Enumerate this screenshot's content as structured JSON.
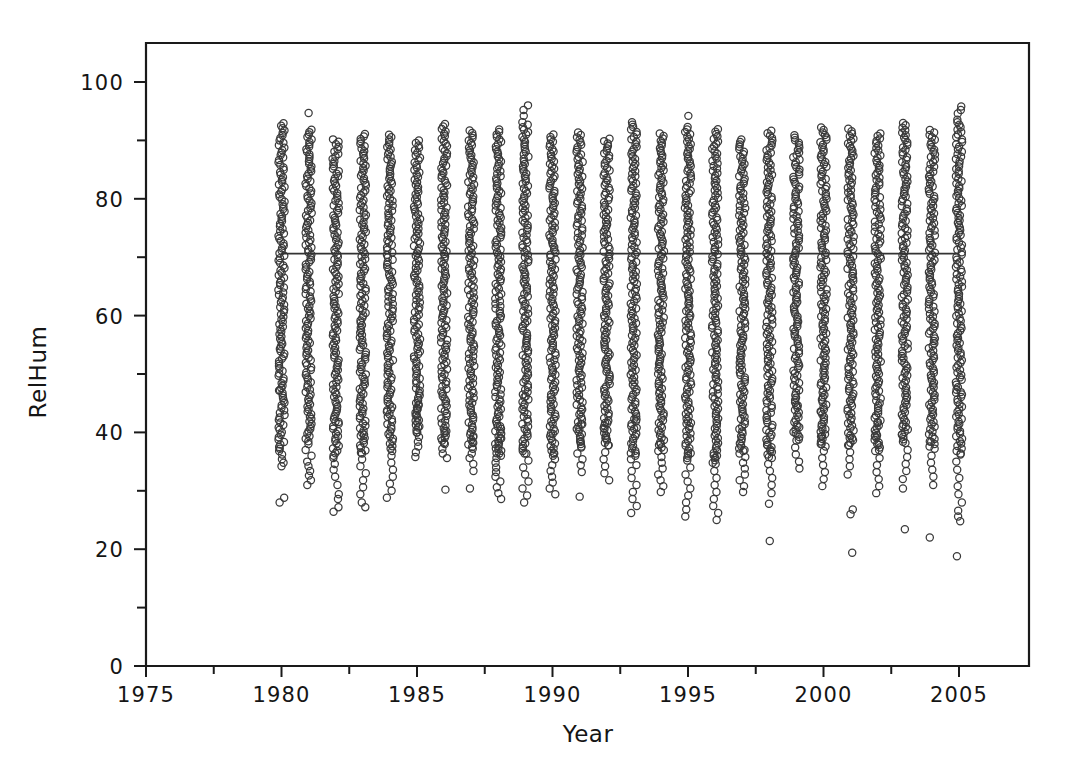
{
  "chart_data": {
    "type": "scatter",
    "title": "",
    "xlabel": "Year",
    "ylabel": "RelHum",
    "xlim": [
      1974,
      2006.5
    ],
    "ylim": [
      0,
      107
    ],
    "grid": false,
    "legend": "none",
    "marker": "open-circle",
    "x_ticks": [
      1975,
      1980,
      1985,
      1990,
      1995,
      2000,
      2005
    ],
    "x_tick_labels": [
      "1975",
      "1980",
      "1985",
      "1990",
      "1995",
      "2000",
      "2005"
    ],
    "x_minor_ticks": [
      1977.5,
      1982.5,
      1987.5,
      1992.5,
      1997.5,
      2002.5
    ],
    "y_ticks": [
      0,
      20,
      40,
      60,
      80,
      100
    ],
    "y_tick_labels": [
      "0",
      "20",
      "40",
      "60",
      "80",
      "100"
    ],
    "y_minor_ticks": [
      10,
      30,
      50,
      70,
      90
    ],
    "reference_line": {
      "type": "horizontal",
      "y": 70.6,
      "x_start": 1980,
      "x_end": 2005,
      "label": ""
    },
    "series": [
      {
        "name": "RelHum",
        "columns": [
          {
            "year": 1980,
            "min": 28.0,
            "max": 93.6,
            "dense_low": 37.5,
            "dense_high": 93.0,
            "sparse": [
              28.0,
              28.8,
              34.2,
              34.8,
              35.4,
              36.2,
              36.8,
              37.2,
              47.2
            ]
          },
          {
            "year": 1981,
            "min": 31.0,
            "max": 94.7,
            "dense_low": 38.5,
            "dense_high": 92.2,
            "sparse": [
              31.0,
              31.8,
              32.6,
              33.4,
              34.2,
              35.0,
              36.0,
              37.0,
              38.0,
              94.7
            ]
          },
          {
            "year": 1982,
            "min": 26.4,
            "max": 90.6,
            "dense_low": 36.0,
            "dense_high": 90.2,
            "sparse": [
              26.4,
              27.2,
              28.6,
              29.4,
              31.0,
              32.4,
              33.6,
              34.6,
              35.6,
              41.8
            ]
          },
          {
            "year": 1983,
            "min": 27.2,
            "max": 91.6,
            "dense_low": 36.5,
            "dense_high": 91.2,
            "sparse": [
              27.2,
              28.0,
              29.4,
              30.6,
              31.8,
              33.0,
              34.2,
              35.4,
              36.4,
              39.6
            ]
          },
          {
            "year": 1984,
            "min": 28.8,
            "max": 91.6,
            "dense_low": 36.8,
            "dense_high": 91.2,
            "sparse": [
              28.8,
              30.0,
              31.2,
              32.4,
              33.6,
              34.8,
              36.0,
              43.8
            ]
          },
          {
            "year": 1985,
            "min": 35.8,
            "max": 90.6,
            "dense_low": 40.0,
            "dense_high": 90.2,
            "sparse": [
              35.8,
              36.6,
              37.6,
              38.4,
              39.2,
              40.0,
              41.0,
              42.0,
              43.0,
              44.0,
              44.8
            ]
          },
          {
            "year": 1986,
            "min": 30.2,
            "max": 93.4,
            "dense_low": 38.2,
            "dense_high": 93.0,
            "sparse": [
              30.2,
              35.6,
              36.4,
              37.2,
              38.0,
              39.0,
              40.2
            ]
          },
          {
            "year": 1987,
            "min": 30.4,
            "max": 92.4,
            "dense_low": 37.5,
            "dense_high": 92.0,
            "sparse": [
              30.4,
              33.4,
              34.6,
              35.6,
              36.4,
              37.2,
              38.2,
              39.4
            ]
          },
          {
            "year": 1988,
            "min": 28.6,
            "max": 92.6,
            "dense_low": 36.0,
            "dense_high": 92.2,
            "sparse": [
              28.6,
              29.6,
              30.6,
              31.6,
              32.4,
              33.2,
              34.0,
              34.8,
              35.6,
              36.4,
              37.2,
              38.0,
              39.0,
              40.2,
              41.0
            ]
          },
          {
            "year": 1989,
            "min": 28.0,
            "max": 96.0,
            "dense_low": 36.4,
            "dense_high": 93.2,
            "sparse": [
              28.0,
              29.2,
              30.4,
              31.6,
              32.8,
              34.0,
              35.2,
              36.4,
              46.2,
              94.2,
              95.2,
              96.0
            ]
          },
          {
            "year": 1990,
            "min": 29.4,
            "max": 91.6,
            "dense_low": 36.0,
            "dense_high": 91.2,
            "sparse": [
              29.4,
              30.4,
              31.4,
              32.4,
              33.4,
              34.4,
              35.4,
              36.4,
              39.8
            ]
          },
          {
            "year": 1991,
            "min": 29.0,
            "max": 91.8,
            "dense_low": 37.6,
            "dense_high": 91.4,
            "sparse": [
              29.0,
              33.2,
              34.4,
              35.4,
              36.4,
              37.4,
              38.4,
              40.6,
              41.4
            ]
          },
          {
            "year": 1992,
            "min": 31.8,
            "max": 91.8,
            "dense_low": 37.8,
            "dense_high": 90.6,
            "sparse": [
              31.8,
              33.0,
              34.2,
              35.4,
              36.6,
              37.8,
              39.0,
              40.6,
              41.6
            ]
          },
          {
            "year": 1993,
            "min": 26.2,
            "max": 93.6,
            "dense_low": 36.0,
            "dense_high": 93.2,
            "sparse": [
              26.2,
              27.4,
              28.6,
              29.8,
              31.0,
              32.2,
              33.4,
              34.4,
              35.4,
              36.4,
              40.8,
              42.2
            ]
          },
          {
            "year": 1994,
            "min": 29.8,
            "max": 92.0,
            "dense_low": 37.0,
            "dense_high": 91.6,
            "sparse": [
              29.8,
              30.8,
              31.8,
              32.8,
              33.8,
              34.8,
              35.8,
              36.8,
              38.0
            ]
          },
          {
            "year": 1995,
            "min": 25.6,
            "max": 94.2,
            "dense_low": 35.6,
            "dense_high": 92.6,
            "sparse": [
              25.6,
              26.8,
              28.0,
              29.2,
              30.4,
              31.6,
              32.8,
              34.0,
              35.2,
              36.4,
              41.6,
              94.2
            ]
          },
          {
            "year": 1996,
            "min": 25.0,
            "max": 92.4,
            "dense_low": 34.8,
            "dense_high": 92.0,
            "sparse": [
              25.0,
              26.2,
              27.4,
              28.6,
              29.8,
              31.0,
              32.2,
              33.4,
              34.6,
              36.0
            ]
          },
          {
            "year": 1997,
            "min": 29.8,
            "max": 90.6,
            "dense_low": 36.4,
            "dense_high": 90.2,
            "sparse": [
              29.8,
              30.8,
              31.8,
              32.8,
              33.8,
              34.8,
              35.8,
              37.0
            ]
          },
          {
            "year": 1998,
            "min": 21.4,
            "max": 92.2,
            "dense_low": 35.8,
            "dense_high": 91.8,
            "sparse": [
              21.4,
              27.8,
              29.6,
              31.0,
              32.2,
              33.4,
              34.6,
              35.6,
              36.8,
              37.8
            ]
          },
          {
            "year": 1999,
            "min": 33.8,
            "max": 93.2,
            "dense_low": 38.8,
            "dense_high": 91.2,
            "sparse": [
              33.8,
              35.0,
              36.2,
              37.4,
              38.6,
              39.8,
              41.0,
              44.6
            ]
          },
          {
            "year": 2000,
            "min": 30.8,
            "max": 93.0,
            "dense_low": 37.6,
            "dense_high": 92.6,
            "sparse": [
              30.8,
              32.0,
              33.2,
              34.4,
              35.6,
              36.8,
              38.0,
              39.4,
              40.6,
              43.6
            ]
          },
          {
            "year": 2001,
            "min": 19.4,
            "max": 92.6,
            "dense_low": 37.8,
            "dense_high": 92.2,
            "sparse": [
              19.4,
              26.0,
              26.8,
              32.8,
              34.2,
              35.4,
              36.6,
              37.8,
              39.0
            ]
          },
          {
            "year": 2002,
            "min": 29.6,
            "max": 91.8,
            "dense_low": 37.0,
            "dense_high": 91.4,
            "sparse": [
              29.6,
              30.8,
              32.0,
              33.2,
              34.4,
              35.6,
              36.8,
              38.0,
              39.4,
              41.8
            ]
          },
          {
            "year": 2003,
            "min": 23.4,
            "max": 93.6,
            "dense_low": 38.4,
            "dense_high": 93.2,
            "sparse": [
              23.4,
              30.4,
              32.0,
              33.4,
              34.6,
              35.8,
              37.0,
              38.2,
              39.6,
              41.0
            ]
          },
          {
            "year": 2004,
            "min": 22.0,
            "max": 92.2,
            "dense_low": 37.6,
            "dense_high": 91.8,
            "sparse": [
              22.0,
              31.0,
              32.4,
              33.6,
              34.8,
              36.0,
              37.2,
              38.4
            ]
          },
          {
            "year": 2005,
            "min": 18.8,
            "max": 95.8,
            "dense_low": 36.4,
            "dense_high": 93.6,
            "sparse": [
              18.8,
              24.8,
              25.6,
              26.6,
              28.0,
              29.4,
              30.8,
              32.2,
              33.6,
              35.0,
              36.2,
              46.8,
              94.6,
              95.2,
              95.8
            ]
          }
        ]
      }
    ]
  },
  "axes": {
    "x_title": "Year",
    "y_title": "RelHum"
  }
}
